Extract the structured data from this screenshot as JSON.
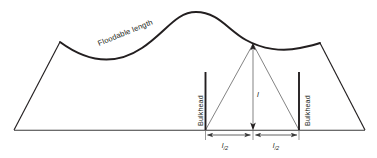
{
  "figure": {
    "type": "technical-line-diagram",
    "background_color": "#ffffff",
    "line_color": "#231f20",
    "thin_line_color": "#6d6d6d",
    "width": 377,
    "height": 158
  },
  "labels": {
    "floodable_length": "Floodable length",
    "bulkhead_left": "Bulkhead",
    "bulkhead_right": "Bulkhead",
    "length_l": "l",
    "half_length_left_main": "l",
    "half_length_left_sub": "/2",
    "half_length_right_main": "l",
    "half_length_right_sub": "/2"
  },
  "geometry": {
    "baseline_y": 130,
    "baseline_x_start": 14,
    "baseline_x_end": 365,
    "left_shoulder": {
      "x": 60,
      "y": 42
    },
    "curve_peak": {
      "x": 196,
      "y": 12
    },
    "right_shoulder": {
      "x": 320,
      "y": 43
    },
    "apex_point": {
      "x": 253,
      "y": 43
    },
    "bulkhead_left_x": 205,
    "bulkhead_right_x": 299,
    "bulkhead_top_y": 72,
    "dimension_line_y": 135
  }
}
